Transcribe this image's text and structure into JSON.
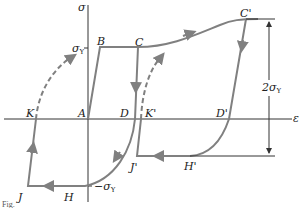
{
  "diagram": {
    "type": "stress-strain hysteresis loop",
    "axes": {
      "x_label": "ε",
      "y_label": "σ"
    },
    "ticks": {
      "sigma_y_pos": "σ",
      "sigma_y_pos_sub": "Y",
      "sigma_y_neg": "−σ",
      "sigma_y_neg_sub": "Y"
    },
    "points": {
      "A": "A",
      "B": "B",
      "C": "C",
      "C_prime": "C'",
      "D": "D",
      "D_prime": "D'",
      "H": "H",
      "H_prime": "H'",
      "J": "J",
      "J_prime": "J'",
      "K": "K",
      "K_prime": "K'"
    },
    "dimension": {
      "label": "2σ",
      "label_sub": "Y"
    },
    "caption": "Fig."
  },
  "colors": {
    "curve": "#808080",
    "axis": "#333333",
    "text": "#222222"
  }
}
